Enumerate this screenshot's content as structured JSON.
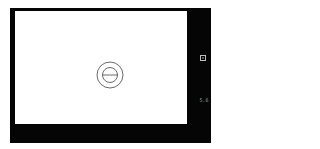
{
  "viewfinder": {
    "reticle": "center-focus-reticle",
    "indicators": {
      "frame_icon": "focus-frame-icon",
      "aperture_value": "5.6"
    }
  }
}
